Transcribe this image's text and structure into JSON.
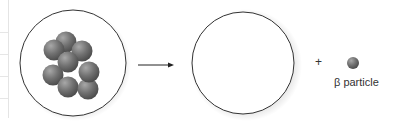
{
  "diagram": {
    "type": "beta-decay",
    "parent_nucleus": {
      "nucleon_count_visible": 8,
      "nucleon_color": "#707070"
    },
    "arrow": {
      "direction": "right"
    },
    "daughter_nucleus": {
      "contents": "empty"
    },
    "operator": "+",
    "emitted_particle": {
      "label": "β particle",
      "color": "#808080"
    }
  }
}
